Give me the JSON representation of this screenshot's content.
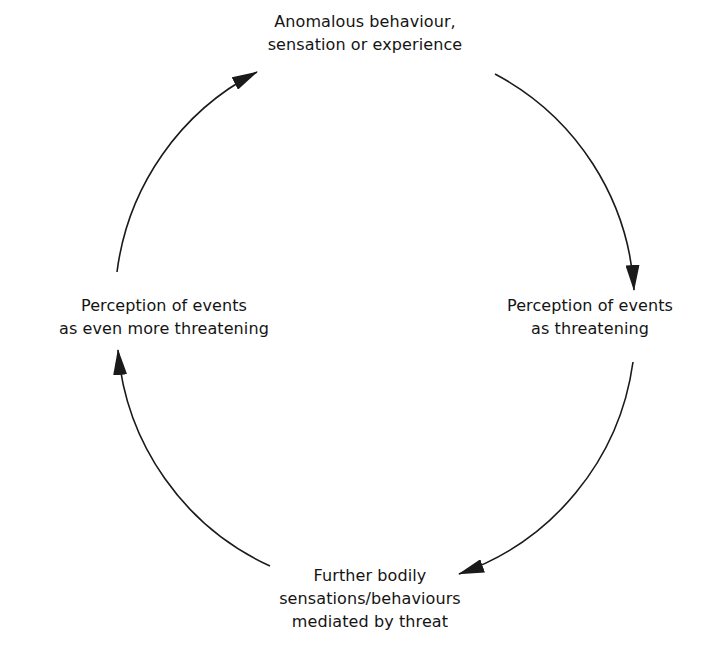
{
  "diagram": {
    "type": "cycle",
    "direction": "clockwise",
    "line_color": "#1a1a1a",
    "background_color": "#ffffff",
    "nodes": [
      {
        "id": "top",
        "lines": [
          "Anomalous behaviour,",
          "sensation or experience"
        ]
      },
      {
        "id": "right",
        "lines": [
          "Perception of events",
          "as threatening"
        ]
      },
      {
        "id": "bottom",
        "lines": [
          "Further bodily",
          "sensations/behaviours",
          "mediated by threat"
        ]
      },
      {
        "id": "left",
        "lines": [
          "Perception of events",
          "as even more threatening"
        ]
      }
    ],
    "edges": [
      {
        "from": "top",
        "to": "right",
        "icon": "arrow-head"
      },
      {
        "from": "right",
        "to": "bottom",
        "icon": "arrow-head"
      },
      {
        "from": "bottom",
        "to": "left",
        "icon": "arrow-head"
      },
      {
        "from": "left",
        "to": "top",
        "icon": "arrow-head"
      }
    ]
  }
}
